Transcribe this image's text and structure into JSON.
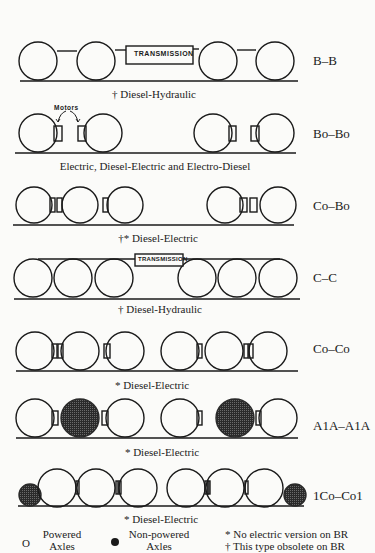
{
  "motors_label": "Motors",
  "transmission_label": "TRANSMISSION",
  "rows": [
    {
      "code": "B–B",
      "caption": "† Diesel-Hydraulic"
    },
    {
      "code": "Bo–Bo",
      "caption": "Electric, Diesel-Electric and Electro-Diesel"
    },
    {
      "code": "Co–Bo",
      "caption": "†* Diesel-Electric"
    },
    {
      "code": "C–C",
      "caption": "† Diesel-Hydraulic"
    },
    {
      "code": "Co–Co",
      "caption": "* Diesel-Electric"
    },
    {
      "code": "A1A–A1A",
      "caption": "* Diesel-Electric"
    },
    {
      "code": "1Co–Co1",
      "caption": "* Diesel-Electric"
    }
  ],
  "legend": {
    "powered_symbol": "O",
    "powered_line1": "Powered",
    "powered_line2": "Axles",
    "nonpowered_line1": "Non-powered",
    "nonpowered_line2": "Axles",
    "note1": "* No electric version on BR",
    "note2": "† This type obsolete on BR"
  },
  "colors": {
    "line": "#1a1a1a",
    "filled": "#3a3a3a",
    "background": "#fbfbf9"
  }
}
